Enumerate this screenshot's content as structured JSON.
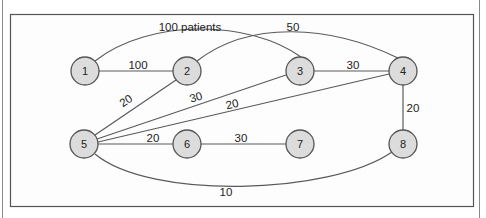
{
  "diagram": {
    "type": "weighted-network",
    "nodes": [
      {
        "id": "1",
        "label": "1",
        "x": 85,
        "y": 71
      },
      {
        "id": "2",
        "label": "2",
        "x": 187,
        "y": 71
      },
      {
        "id": "3",
        "label": "3",
        "x": 300,
        "y": 71
      },
      {
        "id": "4",
        "label": "4",
        "x": 403,
        "y": 71
      },
      {
        "id": "5",
        "label": "5",
        "x": 84,
        "y": 144
      },
      {
        "id": "6",
        "label": "6",
        "x": 187,
        "y": 144
      },
      {
        "id": "7",
        "label": "7",
        "x": 300,
        "y": 144
      },
      {
        "id": "8",
        "label": "8",
        "x": 403,
        "y": 144
      }
    ],
    "edges": [
      {
        "from": "1",
        "to": "3",
        "label": "100 patients"
      },
      {
        "from": "1",
        "to": "2",
        "label": "100"
      },
      {
        "from": "2",
        "to": "4",
        "label": "50"
      },
      {
        "from": "3",
        "to": "4",
        "label": "30"
      },
      {
        "from": "5",
        "to": "2",
        "label": "20"
      },
      {
        "from": "5",
        "to": "3",
        "label": "30"
      },
      {
        "from": "5",
        "to": "4",
        "label": "20"
      },
      {
        "from": "4",
        "to": "8",
        "label": "20"
      },
      {
        "from": "5",
        "to": "6",
        "label": "20"
      },
      {
        "from": "6",
        "to": "7",
        "label": "30"
      },
      {
        "from": "5",
        "to": "8",
        "label": "10"
      }
    ]
  }
}
